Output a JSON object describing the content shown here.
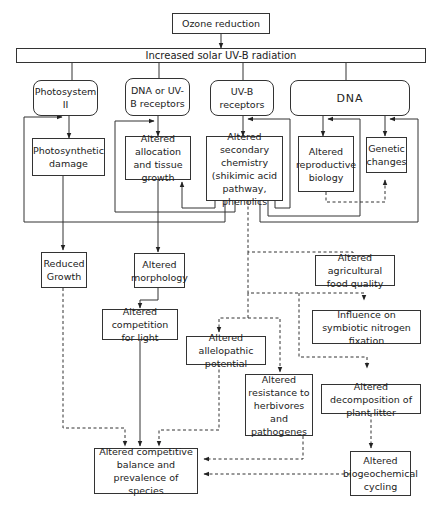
{
  "diagram": {
    "nodes": {
      "ozone": "Ozone reduction",
      "uvb": "Increased solar UV-B radiation",
      "ps2": "Photosystem II",
      "dna_uvb": "DNA or UV-B receptors",
      "uvb_receptors": "UV-B receptors",
      "dna": "DNA",
      "photo_damage": "Photosynthetic damage",
      "allocation": "Altered allocation and tissue growth",
      "secondary_chem": "Altered secondary chemistry (shikimic acid pathway, phenolics",
      "reproductive": "Altered reproductive biology",
      "genetic": "Genetic changes",
      "reduced_growth": "Reduced Growth",
      "morphology": "Altered morphology",
      "ag_food": "Altered agricultural food quality",
      "nitrogen": "Influence on symbiotic nitrogen fixation",
      "competition_light": "Altered competition for light",
      "allelopathic": "Altered allelopathic potential",
      "resistance": "Altered resistance to herbivores and pathogenes",
      "decomposition": "Altered decomposition of plant litter",
      "competitive_balance": "Altered competitive balance and prevalence of species",
      "biogeochemical": "Altered biogeochemical cycling"
    },
    "edges_solid": [
      [
        "ozone",
        "uvb"
      ],
      [
        "uvb",
        "ps2"
      ],
      [
        "uvb",
        "dna_uvb"
      ],
      [
        "uvb",
        "uvb_receptors"
      ],
      [
        "uvb",
        "dna"
      ],
      [
        "ps2",
        "photo_damage"
      ],
      [
        "dna_uvb",
        "allocation"
      ],
      [
        "uvb_receptors",
        "secondary_chem"
      ],
      [
        "dna",
        "reproductive"
      ],
      [
        "dna",
        "genetic"
      ],
      [
        "secondary_chem",
        "allocation"
      ],
      [
        "secondary_chem",
        "photo_damage"
      ],
      [
        "secondary_chem",
        "uvb_receptors"
      ],
      [
        "secondary_chem",
        "reproductive"
      ],
      [
        "secondary_chem",
        "genetic"
      ],
      [
        "photo_damage",
        "reduced_growth"
      ],
      [
        "allocation",
        "morphology"
      ],
      [
        "morphology",
        "competition_light"
      ],
      [
        "competition_light",
        "competitive_balance"
      ]
    ],
    "edges_dashed": [
      [
        "reproductive",
        "genetic"
      ],
      [
        "secondary_chem",
        "ag_food"
      ],
      [
        "secondary_chem",
        "nitrogen"
      ],
      [
        "secondary_chem",
        "allelopathic"
      ],
      [
        "secondary_chem",
        "resistance"
      ],
      [
        "secondary_chem",
        "decomposition"
      ],
      [
        "reduced_growth",
        "competitive_balance"
      ],
      [
        "allelopathic",
        "competitive_balance"
      ],
      [
        "resistance",
        "competitive_balance"
      ],
      [
        "decomposition",
        "biogeochemical"
      ],
      [
        "biogeochemical",
        "competitive_balance"
      ]
    ]
  }
}
